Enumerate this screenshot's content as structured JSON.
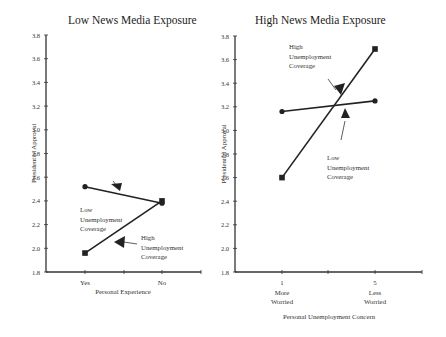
{
  "chart_data": [
    {
      "type": "line",
      "title": "Low News Media Exposure",
      "xlabel": "Personal Experience",
      "ylabel": "Presidential Approval",
      "ylim": [
        1.8,
        3.8
      ],
      "yticks": [
        "3.8",
        "3.6",
        "3.4",
        "3.2",
        "3.0",
        "2.8",
        "2.6",
        "2.4",
        "2.2",
        "2.0",
        "1.8"
      ],
      "categories": [
        "Yes",
        "No"
      ],
      "series": [
        {
          "name": "Low Unemployment Coverage",
          "marker": "circle",
          "values": [
            2.52,
            2.38
          ]
        },
        {
          "name": "High Unemployment Coverage",
          "marker": "square",
          "values": [
            1.96,
            2.4
          ]
        }
      ],
      "annotations": [
        {
          "text": [
            "Low",
            "Unemployment",
            "Coverage"
          ],
          "points_to": "Low Unemployment Coverage"
        },
        {
          "text": [
            "High",
            "Unemployment",
            "Coverage"
          ],
          "points_to": "High Unemployment Coverage"
        }
      ],
      "grid": false
    },
    {
      "type": "line",
      "title": "High News Media Exposure",
      "xlabel": "Personal Unemployment Concern",
      "ylabel": "Presidential Approval",
      "ylim": [
        1.8,
        3.8
      ],
      "yticks": [
        "3.8",
        "3.6",
        "3.4",
        "3.2",
        "3.0",
        "2.8",
        "2.6",
        "2.4",
        "2.2",
        "2.0",
        "1.8"
      ],
      "categories": [
        "1 More Worried",
        "5 Less Worried"
      ],
      "category_lines": [
        [
          "1",
          "More",
          "Worried"
        ],
        [
          "5",
          "Less",
          "Worried"
        ]
      ],
      "series": [
        {
          "name": "Low Unemployment Coverage",
          "marker": "circle",
          "values": [
            3.16,
            3.25
          ]
        },
        {
          "name": "High Unemployment Coverage",
          "marker": "square",
          "values": [
            2.6,
            3.69
          ]
        }
      ],
      "annotations": [
        {
          "text": [
            "High",
            "Unemployment",
            "Coverage"
          ],
          "points_to": "High Unemployment Coverage"
        },
        {
          "text": [
            "Low",
            "Unemployment",
            "Coverage"
          ],
          "points_to": "Low Unemployment Coverage"
        }
      ],
      "grid": false
    }
  ]
}
